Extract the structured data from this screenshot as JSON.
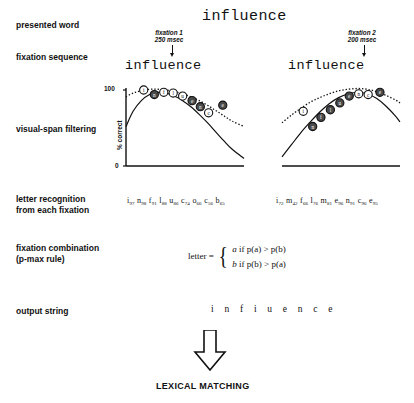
{
  "figure": {
    "title_word": "influence"
  },
  "rows": [
    {
      "id": "presented-word",
      "label": "presented word"
    },
    {
      "id": "fixation-sequence",
      "label": "fixation sequence"
    },
    {
      "id": "visual-span",
      "label": "visual-span filtering"
    },
    {
      "id": "letter-recognition",
      "label": "letter recognition\nfrom each fixation"
    },
    {
      "id": "fixation-combination",
      "label": "fixation combination\n(p-max rule)"
    },
    {
      "id": "output-string",
      "label": "output string"
    }
  ],
  "presented_word": "influence",
  "fixations": [
    {
      "id": "fixation-1",
      "note": "fixation 1\n250 msec",
      "word": "influence",
      "arrow_target_letter_index": 2
    },
    {
      "id": "fixation-2",
      "note": "fixation 2\n200 msec",
      "word": "influence",
      "arrow_target_letter_index": 6
    }
  ],
  "chart_data": [
    {
      "type": "line",
      "id": "visual-span-fixation-1",
      "title": "",
      "xlabel": "",
      "ylabel": "% correct",
      "ylim": [
        0,
        100
      ],
      "yticks": [
        0,
        100
      ],
      "ytick_labels": [
        "0",
        "100"
      ],
      "grid": false,
      "legend": "none",
      "series": [
        {
          "name": "visual span profile (solid)",
          "style": "solid",
          "x": [
            0,
            6,
            13,
            20,
            27,
            34,
            41,
            48,
            55,
            62,
            69,
            76,
            83,
            90,
            100
          ],
          "values": [
            52,
            72,
            86,
            94,
            97,
            96,
            92,
            86,
            78,
            68,
            57,
            45,
            33,
            22,
            10
          ]
        },
        {
          "name": "upper envelope (dotted)",
          "style": "dotted",
          "x": [
            0,
            6,
            13,
            20,
            27,
            34,
            41,
            48,
            55,
            62,
            69,
            76,
            83,
            90,
            100
          ],
          "values": [
            91,
            96,
            99,
            101,
            101,
            100,
            98,
            95,
            91,
            86,
            80,
            73,
            66,
            59,
            52
          ]
        }
      ],
      "points": [
        {
          "letter": "i",
          "x": 15,
          "y": 100,
          "filled": false
        },
        {
          "letter": "n",
          "x": 24,
          "y": 94,
          "filled": true
        },
        {
          "letter": "f",
          "x": 32,
          "y": 97,
          "filled": false
        },
        {
          "letter": "l",
          "x": 40,
          "y": 96,
          "filled": false
        },
        {
          "letter": "u",
          "x": 48,
          "y": 92,
          "filled": false
        },
        {
          "letter": "e",
          "x": 56,
          "y": 86,
          "filled": true
        },
        {
          "letter": "n",
          "x": 63,
          "y": 78,
          "filled": true
        },
        {
          "letter": "c",
          "x": 70,
          "y": 70,
          "filled": false
        },
        {
          "letter": "e",
          "x": 82,
          "y": 80,
          "filled": true
        }
      ]
    },
    {
      "type": "line",
      "id": "visual-span-fixation-2",
      "title": "",
      "xlabel": "",
      "ylabel": "",
      "ylim": [
        0,
        100
      ],
      "yticks": [],
      "ytick_labels": [],
      "grid": false,
      "legend": "none",
      "series": [
        {
          "name": "visual span profile (solid)",
          "style": "solid",
          "x": [
            0,
            8,
            16,
            24,
            32,
            40,
            48,
            56,
            64,
            72,
            80,
            88,
            96,
            100
          ],
          "values": [
            12,
            28,
            44,
            58,
            71,
            82,
            90,
            95,
            97,
            95,
            89,
            79,
            66,
            58
          ]
        },
        {
          "name": "upper envelope (dotted)",
          "style": "dotted",
          "x": [
            0,
            8,
            16,
            24,
            32,
            40,
            48,
            56,
            64,
            72,
            80,
            88,
            96,
            100
          ],
          "values": [
            57,
            67,
            76,
            84,
            90,
            95,
            99,
            101,
            102,
            101,
            98,
            93,
            87,
            83
          ]
        }
      ],
      "points": [
        {
          "letter": "i",
          "x": 18,
          "y": 72,
          "filled": false
        },
        {
          "letter": "n",
          "x": 26,
          "y": 52,
          "filled": true
        },
        {
          "letter": "f",
          "x": 33,
          "y": 64,
          "filled": true
        },
        {
          "letter": "l",
          "x": 41,
          "y": 74,
          "filled": true
        },
        {
          "letter": "u",
          "x": 49,
          "y": 83,
          "filled": true
        },
        {
          "letter": "e",
          "x": 57,
          "y": 92,
          "filled": true
        },
        {
          "letter": "n",
          "x": 65,
          "y": 95,
          "filled": false
        },
        {
          "letter": "c",
          "x": 73,
          "y": 94,
          "filled": false
        },
        {
          "letter": "e",
          "x": 83,
          "y": 97,
          "filled": true
        }
      ]
    }
  ],
  "letter_recognition": {
    "fixation_1": [
      {
        "letter": "i",
        "pct": "97"
      },
      {
        "letter": "n",
        "pct": "98"
      },
      {
        "letter": "f",
        "pct": "91"
      },
      {
        "letter": "l",
        "pct": "88"
      },
      {
        "letter": "u",
        "pct": "86"
      },
      {
        "letter": "c",
        "pct": "74"
      },
      {
        "letter": "o",
        "pct": "66"
      },
      {
        "letter": "c",
        "pct": "56"
      },
      {
        "letter": "b",
        "pct": "65"
      }
    ],
    "fixation_2": [
      {
        "letter": "i",
        "pct": "72"
      },
      {
        "letter": "m",
        "pct": "42"
      },
      {
        "letter": "f",
        "pct": "66"
      },
      {
        "letter": "l",
        "pct": "76"
      },
      {
        "letter": "m",
        "pct": "81"
      },
      {
        "letter": "e",
        "pct": "96"
      },
      {
        "letter": "n",
        "pct": "91"
      },
      {
        "letter": "c",
        "pct": "96"
      },
      {
        "letter": "e",
        "pct": "95"
      }
    ]
  },
  "pmax_rule": {
    "lhs": "letter =",
    "case_a": {
      "result": "a",
      "condition": "if  p(a) > p(b)"
    },
    "case_b": {
      "result": "b",
      "condition": "if  p(b) > p(a)"
    }
  },
  "output_string": "i n f i u e n c e",
  "lexical_matching": "LEXICAL MATCHING",
  "colors": {
    "ink": "#111111",
    "paper": "#ffffff"
  }
}
